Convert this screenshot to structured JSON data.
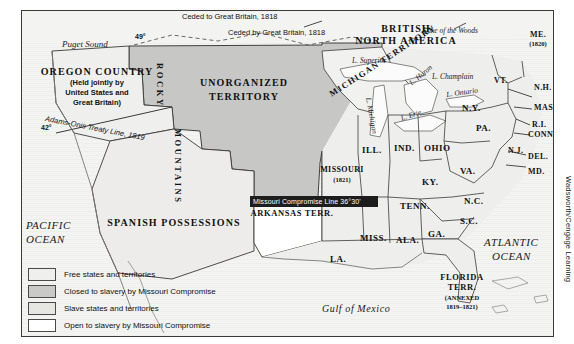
{
  "map": {
    "title": "The Missouri Compromise, 1820",
    "credit": "Wadsworth/Cengage Learning",
    "oceans": [
      {
        "name": "PACIFIC OCEAN",
        "line1": "PACIFIC",
        "line2": "OCEAN"
      },
      {
        "name": "ATLANTIC OCEAN",
        "line1": "ATLANTIC",
        "line2": "OCEAN"
      },
      {
        "name": "Gulf of Mexico",
        "line1": "Gulf of Mexico"
      }
    ],
    "regions": {
      "british": {
        "line1": "BRITISH",
        "line2": "NORTH AMERICA"
      },
      "oregon": {
        "title": "OREGON COUNTRY",
        "sub1": "(Held jointly by",
        "sub2": "United States and",
        "sub3": "Great Britain)"
      },
      "unorganized": {
        "line1": "UNORGANIZED",
        "line2": "TERRITORY"
      },
      "spanish": "SPANISH  POSSESSIONS",
      "rockies": "ROCKY",
      "rockies2": "MOUNTAINS",
      "michigan": "MICHIGAN TERRITORY",
      "arkansas": "ARKANSAS TERR.",
      "florida": {
        "line1": "FLORIDA",
        "line2": "TERR.",
        "line3": "(ANNEXED",
        "line4": "1819–1821)"
      }
    },
    "annotations": {
      "ceded_to": "Ceded to Great Britain, 1818",
      "ceded_by": "Ceded by Great Britain, 1818",
      "adams_onis": "Adams-Onis Treaty Line, 1819",
      "compromise_line": "Missouri Compromise Line 36°30'",
      "lat49": "49°",
      "lat42": "42°"
    },
    "waters": [
      {
        "name": "Puget Sound",
        "label": "Puget Sound"
      },
      {
        "name": "Lake of the Woods",
        "label": "Lake of the Woods"
      },
      {
        "name": "Lake Superior",
        "label": "L. Superior"
      },
      {
        "name": "Lake Michigan",
        "label": "L. Michigan"
      },
      {
        "name": "Lake Huron",
        "label": "L. Huron"
      },
      {
        "name": "Lake Erie",
        "label": "L. Erie"
      },
      {
        "name": "Lake Ontario",
        "label": "L. Ontario"
      },
      {
        "name": "Lake Champlain",
        "label": "L. Champlain"
      }
    ],
    "states": [
      {
        "name": "maine",
        "label": "ME.",
        "year": "(1820)"
      },
      {
        "name": "vermont",
        "label": "VT."
      },
      {
        "name": "new-hampshire",
        "label": "N.H."
      },
      {
        "name": "massachusetts",
        "label": "MASS."
      },
      {
        "name": "rhode-island",
        "label": "R.I."
      },
      {
        "name": "connecticut",
        "label": "CONN."
      },
      {
        "name": "new-york",
        "label": "N.Y."
      },
      {
        "name": "new-jersey",
        "label": "N.J."
      },
      {
        "name": "delaware",
        "label": "DEL."
      },
      {
        "name": "maryland",
        "label": "MD."
      },
      {
        "name": "pennsylvania",
        "label": "PA."
      },
      {
        "name": "ohio",
        "label": "OHIO"
      },
      {
        "name": "indiana",
        "label": "IND."
      },
      {
        "name": "illinois",
        "label": "ILL."
      },
      {
        "name": "virginia",
        "label": "VA."
      },
      {
        "name": "kentucky",
        "label": "KY."
      },
      {
        "name": "north-carolina",
        "label": "N.C."
      },
      {
        "name": "south-carolina",
        "label": "S.C."
      },
      {
        "name": "tennessee",
        "label": "TENN."
      },
      {
        "name": "georgia",
        "label": "GA."
      },
      {
        "name": "alabama",
        "label": "ALA."
      },
      {
        "name": "mississippi",
        "label": "MISS."
      },
      {
        "name": "louisiana",
        "label": "LA."
      },
      {
        "name": "missouri",
        "label": "MISSOURI",
        "year": "(1821)"
      }
    ],
    "legend": [
      {
        "key": "free",
        "label": "Free states and territories",
        "color": "#efefed"
      },
      {
        "key": "closed",
        "label": "Closed to slavery by Missouri Compromise",
        "color": "#c9c9c7"
      },
      {
        "key": "slave",
        "label": "Slave states and territories",
        "color": "#e2e2df"
      },
      {
        "key": "open",
        "label": "Open to slavery by Missouri Compromise",
        "color": "#ffffff"
      }
    ]
  }
}
